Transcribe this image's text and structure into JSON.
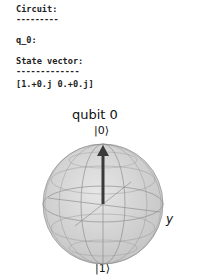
{
  "output": {
    "circuit_heading": "Circuit:",
    "circuit_rule": "---------",
    "qubit_line": "q_0:",
    "state_heading": "State vector:",
    "state_rule": "-------------",
    "state_vector": "[1.+0.j 0.+0.j]"
  },
  "bloch": {
    "title": "qubit 0",
    "top_label": "|0⟩",
    "bottom_label": "|1⟩",
    "x_label": "x",
    "y_label": "y",
    "vector_color": "#3a3a3a",
    "sphere_color": "#d8d8d8"
  }
}
